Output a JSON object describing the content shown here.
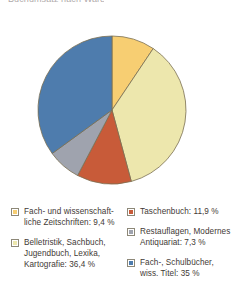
{
  "caption": {
    "cut_off_text": "Buchumsatz nach Warengruppen im Jahr 2002"
  },
  "colors": {
    "amber": "#F7CE72",
    "pale_yellow": "#EDE7AD",
    "red_orange": "#C85B39",
    "gray": "#9FA3AE",
    "blue": "#4E7CAD",
    "slice_outline": "#7a6f52",
    "text": "#3f3a36"
  },
  "chart_data": {
    "type": "pie",
    "title": "",
    "start_angle_deg": 0,
    "direction": "clockwise",
    "legend_position": "bottom",
    "grid": false,
    "unit": "%",
    "decimal_separator": ",",
    "categories": [
      "Fach- und wissenschaftliche Zeitschriften",
      "Belletristik, Sachbuch, Jugendbuch, Lexika, Kartografie",
      "Taschenbuch",
      "Restauflagen, Modernes Antiquariat",
      "Fach-, Schulbücher, wiss. Titel"
    ],
    "values": [
      9.4,
      36.4,
      11.9,
      7.3,
      35.0
    ],
    "slices": [
      {
        "label": "Fach- und wissenschaftliche Zeitschriften",
        "value": 9.4,
        "color": "#F7CE72"
      },
      {
        "label": "Belletristik, Sachbuch, Jugendbuch, Lexika, Kartografie",
        "value": 36.4,
        "color": "#EDE7AD"
      },
      {
        "label": "Taschenbuch",
        "value": 11.9,
        "color": "#C85B39"
      },
      {
        "label": "Restauflagen, Modernes Antiquariat",
        "value": 7.3,
        "color": "#9FA3AE"
      },
      {
        "label": "Fach-, Schulbücher, wiss. Titel",
        "value": 35.0,
        "color": "#4E7CAD"
      }
    ]
  },
  "legend": {
    "left_column": [
      {
        "line1": "Fach- und wissenschaft-",
        "line2": "liche Zeitschriften: 9,4 %",
        "color": "#F7CE72"
      },
      {
        "line1": "Belletristik, Sachbuch,",
        "line2": "Jugendbuch, Lexika,",
        "line3": "Kartografie: 36,4 %",
        "color": "#EDE7AD"
      }
    ],
    "right_column": [
      {
        "line1": "Taschenbuch: 11,9 %",
        "color": "#C85B39"
      },
      {
        "line1": "Restauflagen, Modernes",
        "line2": "Antiquariat: 7,3 %",
        "color": "#9FA3AE"
      },
      {
        "line1": "Fach-, Schulbücher,",
        "line2": "wiss. Titel: 35 %",
        "color": "#4E7CAD"
      }
    ]
  }
}
